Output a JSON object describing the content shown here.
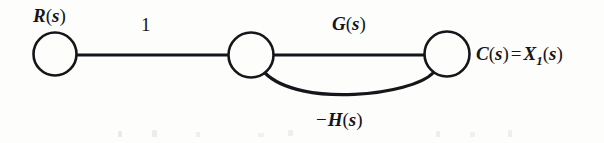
{
  "figure": {
    "type": "signal-flow-graph",
    "background_color": "#fdfdfb",
    "stroke_color": "#15151a",
    "nodes": [
      {
        "id": "input",
        "name": "input-node",
        "label": "R(s)",
        "cx": 55,
        "cy": 54,
        "r": 22
      },
      {
        "id": "summing",
        "name": "summing-node",
        "label": "",
        "cx": 251,
        "cy": 55,
        "r": 23
      },
      {
        "id": "output",
        "name": "output-node",
        "label": "C(s) = X1(s)",
        "cx": 447,
        "cy": 54,
        "r": 23
      }
    ],
    "edges": [
      {
        "id": "e1",
        "name": "edge-input-to-summing",
        "from": "input",
        "to": "summing",
        "gain": "1",
        "shape": "straight",
        "direction": "right"
      },
      {
        "id": "e2",
        "name": "edge-summing-to-output",
        "from": "summing",
        "to": "output",
        "gain": "G(s)",
        "shape": "straight",
        "direction": "right"
      },
      {
        "id": "e3",
        "name": "edge-feedback",
        "from": "output",
        "to": "summing",
        "gain": "-H(s)",
        "shape": "curved",
        "direction": "left"
      }
    ],
    "labels": {
      "input": {
        "base": "R",
        "open": "(",
        "var": "s",
        "close": ")"
      },
      "gain_one": "1",
      "forward_gain": {
        "base": "G",
        "open": "(",
        "var": "s",
        "close": ")"
      },
      "feedback_gain": {
        "minus": "−",
        "base": "H",
        "open": "(",
        "var": "s",
        "close": ")"
      },
      "output": {
        "c_base": "C",
        "c_open": "(",
        "c_var": "s",
        "c_close": ")",
        "equals": "=",
        "x_base": "X",
        "x_sub": "1",
        "x_open": "(",
        "x_var": "s",
        "x_close": ")"
      }
    }
  }
}
